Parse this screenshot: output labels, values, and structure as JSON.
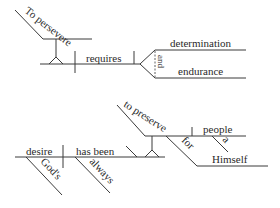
{
  "diagram": {
    "type": "sentence-diagram",
    "stroke_color": "#3a3a3a",
    "text_color": "#2a2a2a",
    "sentence1": {
      "subject_phrase": "To persevere",
      "verb": "requires",
      "conjunction": "and",
      "objects": [
        "determination",
        "endurance"
      ]
    },
    "sentence2": {
      "subject": "desire",
      "subject_modifier": "God's",
      "verb": "has been",
      "adverb": "always",
      "complement_phrase": "to preserve",
      "object": "people",
      "object_modifier": "a",
      "preposition": "for",
      "prep_object": "Himself"
    }
  }
}
